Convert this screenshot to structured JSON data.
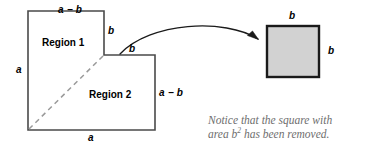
{
  "figure": {
    "background_color": "#ffffff"
  },
  "lshape": {
    "name": "l-shaped-region",
    "stroke_color": "#4a4a4a",
    "fill_color": "#ffffff",
    "outer_width_label": "a",
    "outer_height_label": "a"
  },
  "labels": {
    "top_side": "a − b",
    "left_side": "a",
    "bottom_side": "a",
    "notch_vertical": "b",
    "notch_horizontal": "b",
    "right_side": "a − b",
    "region_one": "Region 1",
    "region_two": "Region 2",
    "square_top": "b",
    "square_right": "b"
  },
  "square": {
    "name": "removed-square",
    "fill_color": "#d2d2d2",
    "stroke_color": "#1a1a1a",
    "top_label": "b",
    "right_label": "b"
  },
  "diagonal": {
    "name": "dashed-diagonal",
    "color": "#9a9a9a",
    "style": "dashed"
  },
  "arrow": {
    "name": "curved-arrow",
    "color": "#1a1a1a",
    "direction": "left-to-right"
  },
  "caption": {
    "line1": "Notice that the square with",
    "line2_prefix": "area b",
    "line2_exponent": "2",
    "line2_suffix": " has been removed.",
    "color": "#6e6e6e"
  }
}
